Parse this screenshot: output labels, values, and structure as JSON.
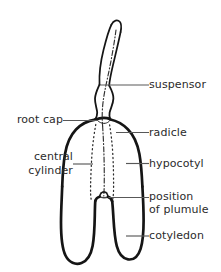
{
  "figure": {
    "background_color": "#ffffff",
    "ink_color": "#151515",
    "text_color": "#2b2b2b",
    "leader_color": "#4a4a4a",
    "width": 221,
    "height": 272
  },
  "labels": {
    "suspensor": "suspensor",
    "root_cap": "root cap",
    "radicle": "radicle",
    "central_cylinder_line1": "central",
    "central_cylinder_line2": "cylinder",
    "hypocotyl": "hypocotyl",
    "plumule_line1": "position",
    "plumule_line2": "of plumule",
    "cotyledon": "cotyledon"
  }
}
